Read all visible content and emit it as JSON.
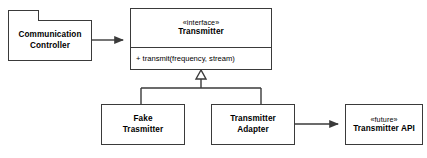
{
  "diagram": {
    "type": "uml-class-diagram",
    "background_color": "#ffffff",
    "line_color": "#3a3a3a",
    "text_color": "#000000"
  },
  "nodes": {
    "communication_controller": {
      "shape": "package",
      "line1": "Communication",
      "line2": "Controller"
    },
    "transmitter_interface": {
      "shape": "class",
      "stereotype": "«interface»",
      "name": "Transmitter",
      "operation": "+ transmit(frequency, stream)"
    },
    "fake_transmitter": {
      "shape": "class",
      "line1": "Fake",
      "line2": "Trasmitter"
    },
    "transmitter_adapter": {
      "shape": "class",
      "line1": "Transmitter",
      "line2": "Adapter"
    },
    "transmitter_api": {
      "shape": "class",
      "stereotype": "«future»",
      "name": "Transmitter API"
    }
  },
  "connectors": [
    {
      "id": "controller-to-interface",
      "from": "communication_controller",
      "to": "transmitter_interface",
      "style": "solid",
      "arrowhead": "filled-arrow"
    },
    {
      "id": "fake-realizes-interface",
      "from": "fake_transmitter",
      "to": "transmitter_interface",
      "style": "solid",
      "arrowhead": "hollow-triangle"
    },
    {
      "id": "adapter-realizes-interface",
      "from": "transmitter_adapter",
      "to": "transmitter_interface",
      "style": "solid",
      "arrowhead": "hollow-triangle"
    },
    {
      "id": "adapter-to-api",
      "from": "transmitter_adapter",
      "to": "transmitter_api",
      "style": "solid",
      "arrowhead": "filled-arrow"
    }
  ]
}
